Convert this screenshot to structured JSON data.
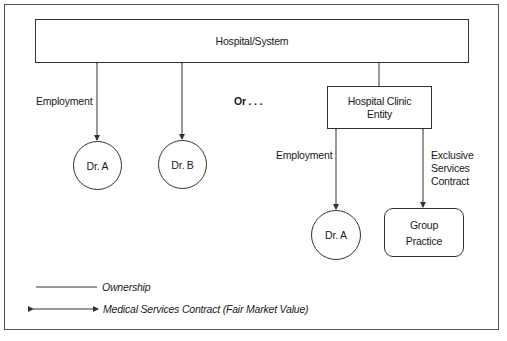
{
  "diagram": {
    "top_entity": {
      "label": "Hospital/System"
    },
    "left_relation_label": "Employment",
    "separator_label": "Or . . .",
    "left_nodes": [
      {
        "label": "Dr. A"
      },
      {
        "label": "Dr. B"
      }
    ],
    "clinic_entity": {
      "line1": "Hospital Clinic",
      "line2": "Entity"
    },
    "right_employment_label": "Employment",
    "right_contract_label": {
      "line1": "Exclusive",
      "line2": "Services",
      "line3": "Contract"
    },
    "right_nodes": {
      "physician": {
        "label": "Dr. A"
      },
      "group": {
        "line1": "Group",
        "line2": "Practice"
      }
    }
  },
  "legend": {
    "ownership": "Ownership",
    "contract": "Medical Services Contract (Fair Market Value)"
  },
  "colors": {
    "line": "#333333",
    "frame": "#555555",
    "background": "#ffffff"
  }
}
